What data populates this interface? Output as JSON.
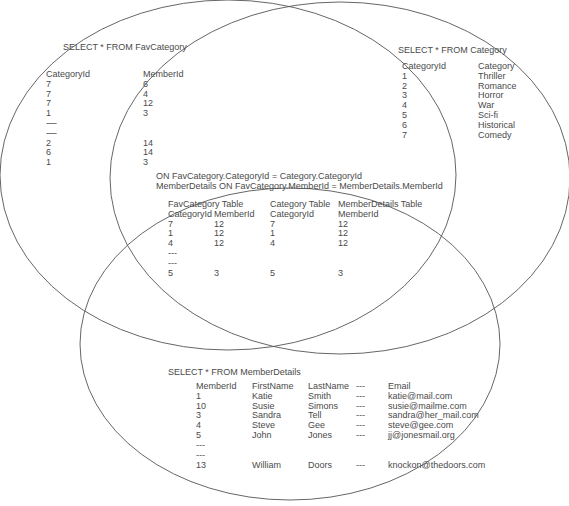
{
  "favcategory": {
    "query": "SELECT * FROM FavCategory",
    "headers": [
      "CategoryId",
      "MemberId"
    ],
    "rows": [
      [
        "7",
        "6"
      ],
      [
        "7",
        "4"
      ],
      [
        "7",
        "12"
      ],
      [
        "1",
        "3"
      ],
      [
        "-----",
        ""
      ],
      [
        "-----",
        ""
      ],
      [
        "2",
        "14"
      ],
      [
        "6",
        "14"
      ],
      [
        "1",
        "3"
      ]
    ]
  },
  "category": {
    "query": "SELECT * FROM Category",
    "headers": [
      "CategoryId",
      "Category"
    ],
    "rows": [
      [
        "1",
        "Thriller"
      ],
      [
        "2",
        "Romance"
      ],
      [
        "3",
        "Horror"
      ],
      [
        "4",
        "War"
      ],
      [
        "5",
        "Sci-fi"
      ],
      [
        "6",
        "Historical"
      ],
      [
        "7",
        "Comedy"
      ]
    ]
  },
  "join": {
    "line1": "ON FavCategory.CategoryId = Category.CategoryId",
    "line2": "MemberDetails ON FavCategory.MemberId = MemberDetails.MemberId",
    "table_titles": [
      "FavCategory Table",
      "Category Table",
      "MemberDetails Table"
    ],
    "headers": [
      "CategoryId",
      "MemberId",
      "CategoryId",
      "MemberId"
    ],
    "rows": [
      [
        "7",
        "12",
        "7",
        "12"
      ],
      [
        "1",
        "12",
        "1",
        "12"
      ],
      [
        "4",
        "12",
        "4",
        "12"
      ],
      [
        "---",
        "",
        "",
        ""
      ],
      [
        "---",
        "",
        "",
        ""
      ],
      [
        "5",
        "3",
        "5",
        "3"
      ]
    ]
  },
  "memberdetails": {
    "query": "SELECT * FROM MemberDetails",
    "headers": [
      "MemberId",
      "FirstName",
      "LastName",
      "---",
      "Email"
    ],
    "rows": [
      [
        "1",
        "Katie",
        "Smith",
        "---",
        "katie@mail.com"
      ],
      [
        "10",
        "Susie",
        "Simons",
        "---",
        "susie@mailme.com"
      ],
      [
        "3",
        "Sandra",
        "Tell",
        "---",
        "sandra@her_mail.com"
      ],
      [
        "4",
        "Steve",
        "Gee",
        "---",
        "steve@gee.com"
      ],
      [
        "5",
        "John",
        "Jones",
        "---",
        "jj@jonesmail.org"
      ],
      [
        "---",
        "",
        "",
        "",
        ""
      ],
      [
        "---",
        "",
        "",
        "",
        ""
      ],
      [
        "13",
        "William",
        "Doors",
        "---",
        "knockon@thedoors.com"
      ]
    ]
  },
  "colors": {
    "line": "#555555",
    "text": "#4a4a4a"
  }
}
